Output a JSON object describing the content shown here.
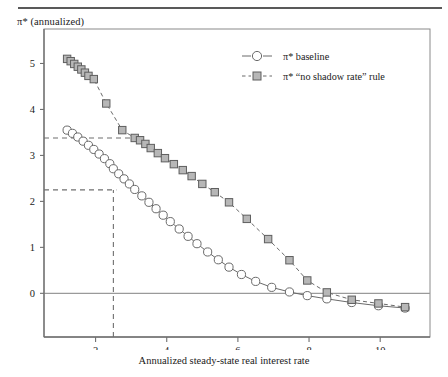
{
  "figure": {
    "y_axis_title": "π* (annualized)",
    "x_axis_title": "Annualized steady-state real interest rate",
    "pi_symbol": "π",
    "star_symbol": "*",
    "y_axis_title_suffix": " (annualized)"
  },
  "legend": {
    "position": "top-right",
    "entries": [
      {
        "label": "π* baseline",
        "marker": "circle",
        "linestyle": "solid",
        "color": "#555555"
      },
      {
        "label": "π* “no shadow rate” rule",
        "marker": "square",
        "linestyle": "dashed",
        "color": "#555555"
      }
    ]
  },
  "annotations": {
    "hline_upper_value": 3.38,
    "hline_lower_value": 2.25,
    "vline_value": 2.5,
    "zero_line_value": 0
  },
  "chart_data": {
    "type": "line",
    "title": "",
    "subtitle": "",
    "xlabel": "Annualized steady-state real interest rate",
    "ylabel": "π* (annualized)",
    "xlim": [
      0.55,
      11.4
    ],
    "ylim": [
      -0.95,
      5.75
    ],
    "xticks": [
      2,
      4,
      6,
      8,
      10
    ],
    "yticks": [
      0,
      1,
      2,
      3,
      4,
      5
    ],
    "grid": false,
    "legend_position": "top-right",
    "series": [
      {
        "name": "π* baseline",
        "marker": "circle",
        "linestyle": "solid",
        "x": [
          1.2,
          1.35,
          1.5,
          1.65,
          1.8,
          1.95,
          2.1,
          2.25,
          2.4,
          2.5,
          2.65,
          2.8,
          2.95,
          3.1,
          3.3,
          3.5,
          3.7,
          3.9,
          4.1,
          4.35,
          4.6,
          4.85,
          5.15,
          5.45,
          5.75,
          6.1,
          6.5,
          6.95,
          7.45,
          7.95,
          8.5,
          9.2,
          9.95,
          10.7
        ],
        "y": [
          3.55,
          3.48,
          3.4,
          3.31,
          3.22,
          3.13,
          3.03,
          2.93,
          2.82,
          2.71,
          2.6,
          2.49,
          2.38,
          2.26,
          2.12,
          1.98,
          1.84,
          1.7,
          1.56,
          1.4,
          1.24,
          1.08,
          0.9,
          0.73,
          0.57,
          0.41,
          0.26,
          0.13,
          0.03,
          -0.05,
          -0.12,
          -0.2,
          -0.27,
          -0.32
        ]
      },
      {
        "name": "π* “no shadow rate” rule",
        "marker": "square",
        "linestyle": "dashed",
        "x": [
          1.2,
          1.3,
          1.4,
          1.5,
          1.6,
          1.7,
          1.8,
          1.95,
          2.3,
          2.75,
          3.1,
          3.25,
          3.4,
          3.55,
          3.75,
          3.95,
          4.2,
          4.45,
          4.7,
          5.0,
          5.35,
          5.75,
          6.25,
          6.85,
          7.45,
          7.95,
          8.5,
          9.2,
          9.95,
          10.7
        ],
        "y": [
          5.1,
          5.05,
          4.99,
          4.93,
          4.87,
          4.8,
          4.73,
          4.66,
          4.13,
          3.55,
          3.38,
          3.33,
          3.25,
          3.16,
          3.05,
          2.94,
          2.81,
          2.68,
          2.55,
          2.38,
          2.2,
          1.98,
          1.62,
          1.18,
          0.72,
          0.28,
          0.02,
          -0.14,
          -0.22,
          -0.3
        ]
      }
    ]
  }
}
